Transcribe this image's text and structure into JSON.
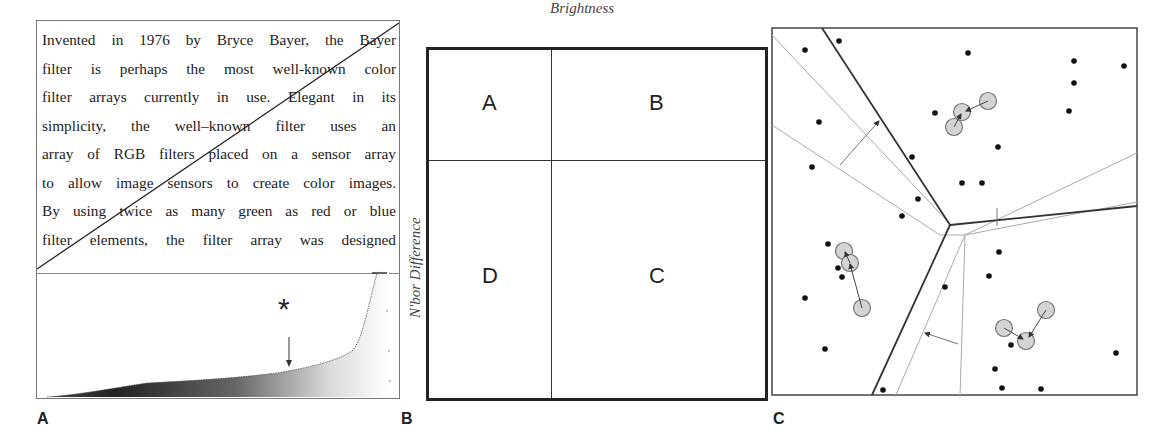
{
  "figure": {
    "panels": [
      {
        "label": "A",
        "text_lines": [
          "Invented in 1976 by Bryce Bayer, the Bayer",
          "filter is perhaps the most well-known color",
          "filter arrays currently in use. Elegant in its",
          "simplicity, the well–known filter uses an",
          "array of RGB filters placed on a sensor array",
          "to allow image sensors to create color images.",
          "By using twice as many green as red or blue",
          "filter elements, the filter array was designed"
        ],
        "marker": "*",
        "histogram": {
          "description": "brightness histogram with dark-to-light gradient fill, rising sharply near the right",
          "marker_position_fraction": 0.69
        }
      },
      {
        "label": "B",
        "x_axis_label": "Brightness",
        "y_axis_label": "N'bor Difference",
        "quadrants": {
          "top_left": "A",
          "top_right": "B",
          "bottom_right": "C",
          "bottom_left": "D"
        }
      },
      {
        "label": "C",
        "description": "Point cloud partitioned by boundary lines with highlighted circular samples and displacement arrows"
      }
    ],
    "colors": {
      "ink": "#222222",
      "light_line": "#aaaaaa",
      "circle_fill": "#d0d0d0",
      "circle_stroke": "#777777"
    }
  }
}
